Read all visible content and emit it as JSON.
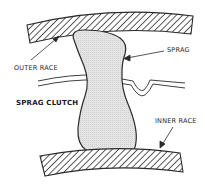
{
  "diagram": {
    "title": "SPRAG CLUTCH",
    "labels": {
      "outer_race": "OUTER RACE",
      "sprag": "SPRAG",
      "inner_race": "INNER RACE"
    },
    "colors": {
      "line": "#2a2a2a",
      "sprag_fill": "#e2e2e2",
      "hatch": "#333333",
      "background": "#ffffff"
    }
  }
}
